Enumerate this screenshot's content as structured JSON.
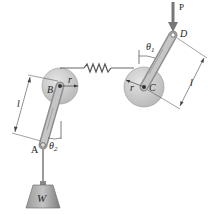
{
  "figure": {
    "type": "mechanism-diagram",
    "labels": {
      "force_P": "P",
      "point_A": "A",
      "point_B": "B",
      "point_C": "C",
      "point_D": "D",
      "radius_B": "r",
      "radius_C": "r",
      "length_left": "l",
      "length_right": "l",
      "theta1": "θ",
      "theta1_sub": "1",
      "theta2": "θ",
      "theta2_sub": "2",
      "weight": "W"
    },
    "colors": {
      "pulley": "#cfcfcf",
      "arm": "#b9b9b9",
      "spring": "#555555",
      "weight": "#8a8a8a",
      "line": "#333333"
    }
  }
}
